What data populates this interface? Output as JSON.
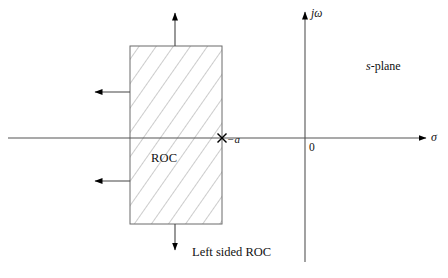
{
  "figure": {
    "type": "s-plane region-of-convergence diagram",
    "background_color": "#ffffff",
    "line_color": "#555555",
    "hatch_color": "#9a9a9a",
    "text_color": "#111111",
    "arrow_color": "#000000"
  },
  "axes": {
    "real_axis": {
      "label": "σ",
      "orientation": "horizontal",
      "y": 138,
      "x_start": 8,
      "x_end": 428,
      "arrow_at": "end"
    },
    "imaginary_axis": {
      "label": "jω",
      "orientation": "vertical",
      "x": 305,
      "y_start": 262,
      "y_end": 10,
      "arrow_at": "top"
    },
    "origin_label": "0"
  },
  "plane_label": {
    "prefix": "s",
    "suffix": "-plane",
    "full": "s-plane"
  },
  "roc_region": {
    "label": "ROC",
    "shape": "rectangle",
    "x": 130,
    "y": 46,
    "width": 92,
    "height": 178,
    "fill": "hatched",
    "hatch_angle_deg": -35,
    "hatch_spacing_px": 14
  },
  "pole": {
    "marker": "x",
    "label": "−a",
    "x": 222,
    "y": 138,
    "description": "pole on the real axis at sigma = -a"
  },
  "direction_arrows": [
    {
      "name": "arrow-up",
      "direction": "up",
      "from_x": 175,
      "from_y": 46,
      "to_x": 175,
      "to_y": 10
    },
    {
      "name": "arrow-left-upper",
      "direction": "left",
      "from_x": 130,
      "from_y": 92,
      "to_x": 92,
      "to_y": 92
    },
    {
      "name": "arrow-left-lower",
      "direction": "left",
      "from_x": 130,
      "from_y": 181,
      "to_x": 92,
      "to_y": 181
    },
    {
      "name": "arrow-down",
      "direction": "down",
      "from_x": 175,
      "from_y": 224,
      "to_x": 175,
      "to_y": 253
    }
  ],
  "caption": {
    "text": "Left sided ROC"
  }
}
